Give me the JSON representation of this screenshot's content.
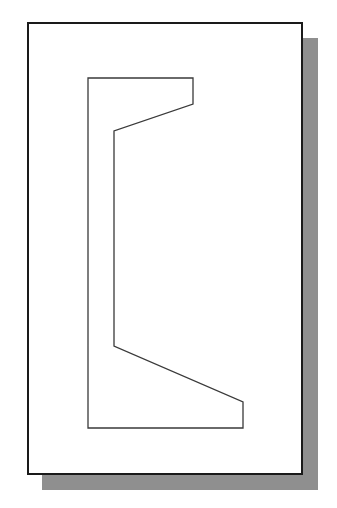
{
  "diagram": {
    "type": "channel-section-profile",
    "canvas": {
      "width": 337,
      "height": 508,
      "background": "#ffffff"
    },
    "shadow": {
      "x": 42,
      "y": 38,
      "width": 276,
      "height": 452,
      "color": "#8f8f8f"
    },
    "frame": {
      "x": 27,
      "y": 22,
      "width": 276,
      "height": 453,
      "border_color": "#1a1a1a",
      "fill": "#ffffff"
    },
    "profile": {
      "stroke": "#3a3a3a",
      "stroke_width": 1.3,
      "points": "88,78 193,78 193,104 114,131 114,346 243,402 243,428 88,428"
    }
  }
}
